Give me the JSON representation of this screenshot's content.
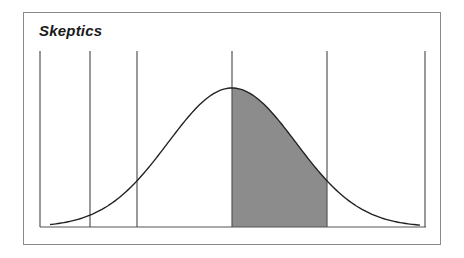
{
  "diagram": {
    "title": "Skeptics",
    "type": "normal-distribution-bell-curve",
    "shaded_segment": {
      "from_line": 3,
      "to_line": 4,
      "color": "#8c8c8c"
    },
    "divider_lines": 6,
    "colors": {
      "frame": "#8a8a8a",
      "curve": "#222222",
      "lines": "#555555",
      "shade": "#8c8c8c"
    }
  }
}
